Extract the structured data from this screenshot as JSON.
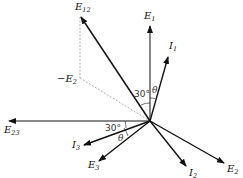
{
  "diagram": {
    "type": "phasor-diagram",
    "origin": [
      150,
      121
    ],
    "phasors": [
      {
        "id": "E1",
        "label": "E",
        "sub": "1",
        "tip": [
          150,
          25
        ],
        "label_pos": [
          144,
          19
        ],
        "style": "solid"
      },
      {
        "id": "I1",
        "label": "I",
        "sub": "1",
        "tip": [
          168,
          56
        ],
        "label_pos": [
          169,
          49
        ],
        "style": "solid"
      },
      {
        "id": "E12",
        "label": "E",
        "sub": "12",
        "tip": [
          80,
          16
        ],
        "label_pos": [
          75,
          10
        ],
        "style": "bold"
      },
      {
        "id": "E23",
        "label": "E",
        "sub": "23",
        "tip": [
          8,
          121
        ],
        "label_pos": [
          4,
          133
        ],
        "style": "solid"
      },
      {
        "id": "I3",
        "label": "I",
        "sub": "3",
        "tip": [
          83,
          145
        ],
        "label_pos": [
          72,
          148
        ],
        "style": "bold"
      },
      {
        "id": "E3",
        "label": "E",
        "sub": "3",
        "tip": [
          98,
          162
        ],
        "label_pos": [
          88,
          168
        ],
        "style": "bold"
      },
      {
        "id": "I2",
        "label": "I",
        "sub": "2",
        "tip": [
          187,
          167
        ],
        "label_pos": [
          189,
          176
        ],
        "style": "bold"
      },
      {
        "id": "E2",
        "label": "E",
        "sub": "2",
        "tip": [
          225,
          164
        ],
        "label_pos": [
          227,
          172
        ],
        "style": "bold"
      }
    ],
    "construction": {
      "neg_E2_label": "−E",
      "neg_E2_sub": "2",
      "neg_E2_point": [
        80,
        78
      ],
      "neg_E2_label_pos": [
        57,
        82
      ]
    },
    "angles": [
      {
        "text": "30°",
        "pos": [
          134,
          97
        ],
        "kind": "degrees"
      },
      {
        "text": "θ",
        "pos": [
          152,
          93
        ],
        "kind": "symbol"
      },
      {
        "text": "30°",
        "pos": [
          105,
          131
        ],
        "kind": "degrees"
      },
      {
        "text": "θ",
        "pos": [
          118,
          141
        ],
        "kind": "symbol"
      }
    ]
  }
}
